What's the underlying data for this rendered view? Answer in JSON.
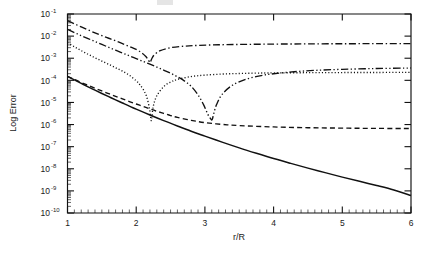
{
  "chart_data": {
    "type": "line",
    "title": "",
    "xlabel": "r/R",
    "ylabel": "Log Error",
    "xlim": [
      1,
      6
    ],
    "ylim": [
      1e-10,
      0.1
    ],
    "yscale": "log",
    "xscale": "linear",
    "grid": false,
    "legend": "none",
    "x_ticks": [
      1,
      2,
      3,
      4,
      5,
      6
    ],
    "x_tick_labels": [
      "1",
      "2",
      "3",
      "4",
      "5",
      "6"
    ],
    "x_minor_tick_step": 0.1,
    "y_ticks": [
      0.1,
      0.01,
      0.001,
      0.0001,
      1e-05,
      1e-06,
      1e-07,
      1e-08,
      1e-09,
      1e-10
    ],
    "y_tick_labels": [
      {
        "mantissa": "10",
        "exponent": "-1"
      },
      {
        "mantissa": "10",
        "exponent": "-2"
      },
      {
        "mantissa": "10",
        "exponent": "-3"
      },
      {
        "mantissa": "10",
        "exponent": "-4"
      },
      {
        "mantissa": "10",
        "exponent": "-5"
      },
      {
        "mantissa": "10",
        "exponent": "-6"
      },
      {
        "mantissa": "10",
        "exponent": "-7"
      },
      {
        "mantissa": "10",
        "exponent": "-8"
      },
      {
        "mantissa": "10",
        "exponent": "-9"
      },
      {
        "mantissa": "10",
        "exponent": "-10"
      }
    ],
    "line_color": "#111111",
    "series": [
      {
        "name": "solid",
        "style": "solid",
        "x": [
          1.0,
          1.1,
          1.2,
          1.3,
          1.4,
          1.5,
          1.6,
          1.7,
          1.8,
          1.9,
          2.0,
          2.2,
          2.4,
          2.6,
          2.8,
          3.0,
          3.25,
          3.5,
          3.75,
          4.0,
          4.25,
          4.5,
          4.75,
          5.0,
          5.25,
          5.5,
          5.75,
          6.0
        ],
        "values": [
          0.00015,
          0.000105,
          7.3e-05,
          5.1e-05,
          3.6e-05,
          2.55e-05,
          1.82e-05,
          1.3e-05,
          9.4e-06,
          6.8e-06,
          5e-06,
          2.7e-06,
          1.5e-06,
          8.6e-07,
          5e-07,
          3e-07,
          1.6e-07,
          8.8e-08,
          5e-08,
          2.9e-08,
          1.75e-08,
          1.07e-08,
          6.7e-09,
          4.2e-09,
          2.7e-09,
          1.75e-09,
          1.1e-09,
          6.2e-10
        ]
      },
      {
        "name": "dashed",
        "style": "dashed",
        "x": [
          1.0,
          1.1,
          1.2,
          1.3,
          1.4,
          1.5,
          1.6,
          1.7,
          1.8,
          1.9,
          2.0,
          2.1,
          2.2,
          2.3,
          2.4,
          2.5,
          2.6,
          2.8,
          3.0,
          3.25,
          3.5,
          4.0,
          4.5,
          5.0,
          5.5,
          6.0
        ],
        "values": [
          0.00015,
          0.00011,
          8e-05,
          5.9e-05,
          4.4e-05,
          3.3e-05,
          2.5e-05,
          1.9e-05,
          1.45e-05,
          1.1e-05,
          8.5e-06,
          6.6e-06,
          5.1e-06,
          4e-06,
          3.2e-06,
          2.55e-06,
          2.1e-06,
          1.55e-06,
          1.22e-06,
          1.02e-06,
          9e-07,
          7.8e-07,
          7.2e-07,
          6.9e-07,
          6.7e-07,
          6.6e-07
        ]
      },
      {
        "name": "dotted",
        "style": "dotted",
        "x": [
          1.0,
          1.1,
          1.2,
          1.3,
          1.4,
          1.5,
          1.6,
          1.7,
          1.8,
          1.9,
          2.0,
          2.05,
          2.1,
          2.15,
          2.19,
          2.21,
          2.22,
          2.23,
          2.25,
          2.3,
          2.4,
          2.5,
          2.6,
          2.8,
          3.0,
          3.25,
          3.5,
          3.75,
          4.0,
          4.5,
          5.0,
          5.5,
          6.0
        ],
        "values": [
          0.005,
          0.0033,
          0.0022,
          0.0015,
          0.00105,
          0.00074,
          0.00053,
          0.00037,
          0.00026,
          0.00017,
          9.5e-05,
          6.5e-05,
          4e-05,
          1.9e-05,
          6e-06,
          2.2e-06,
          1.5e-06,
          2.4e-06,
          7e-06,
          2e-05,
          5.2e-05,
          8.3e-05,
          0.00011,
          0.000148,
          0.000172,
          0.000192,
          0.000204,
          0.000212,
          0.000217,
          0.000222,
          0.000225,
          0.000227,
          0.000228
        ]
      },
      {
        "name": "dash-dot",
        "style": "dashdot",
        "x": [
          1.0,
          1.1,
          1.2,
          1.3,
          1.4,
          1.5,
          1.6,
          1.7,
          1.8,
          1.9,
          2.0,
          2.08,
          2.14,
          2.18,
          2.2,
          2.21,
          2.23,
          2.27,
          2.35,
          2.5,
          2.7,
          2.9,
          3.2,
          3.5,
          3.8,
          4.1,
          4.5,
          5.0,
          5.5,
          6.0
        ],
        "values": [
          0.05,
          0.036,
          0.026,
          0.019,
          0.014,
          0.0105,
          0.008,
          0.0061,
          0.0046,
          0.0034,
          0.0025,
          0.00175,
          0.0012,
          0.0008,
          0.00064,
          0.0007,
          0.001,
          0.0015,
          0.0022,
          0.003,
          0.0035,
          0.0038,
          0.00405,
          0.0042,
          0.0043,
          0.00438,
          0.00445,
          0.00452,
          0.00456,
          0.0046
        ]
      },
      {
        "name": "dash-dot-dot",
        "style": "dashdotdot",
        "x": [
          1.0,
          1.1,
          1.2,
          1.3,
          1.4,
          1.5,
          1.6,
          1.7,
          1.8,
          1.9,
          2.0,
          2.1,
          2.2,
          2.3,
          2.4,
          2.5,
          2.6,
          2.7,
          2.8,
          2.9,
          2.98,
          3.04,
          3.08,
          3.1,
          3.11,
          3.13,
          3.17,
          3.25,
          3.4,
          3.6,
          3.8,
          4.0,
          4.3,
          4.6,
          5.0,
          5.5,
          6.0
        ],
        "values": [
          0.02,
          0.0145,
          0.0105,
          0.0077,
          0.0057,
          0.0042,
          0.0031,
          0.0023,
          0.00172,
          0.00128,
          0.00096,
          0.00072,
          0.00054,
          0.0004,
          0.00029,
          0.00021,
          0.000145,
          9.5e-05,
          5.4e-05,
          2.2e-05,
          8e-06,
          3e-06,
          1.9e-06,
          1.6e-06,
          1.8e-06,
          3.2e-06,
          8e-06,
          2.3e-05,
          6e-05,
          0.000112,
          0.00016,
          0.000198,
          0.000245,
          0.000282,
          0.000315,
          0.000342,
          0.00036
        ]
      }
    ]
  }
}
